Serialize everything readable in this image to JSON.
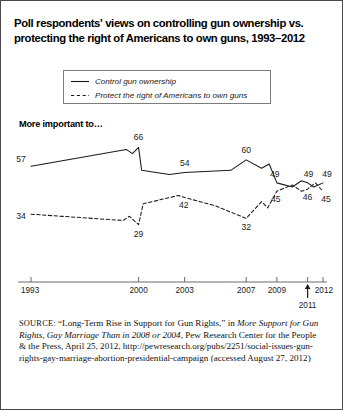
{
  "figure": {
    "title": "Poll respondents' views on controlling gun ownership vs.\nprotecting the right of Americans to own guns, 1993–2012",
    "axis_note": "More important to…"
  },
  "legend": {
    "items": [
      {
        "label": "Control gun ownership",
        "style": "solid",
        "icon": "solid-line-icon"
      },
      {
        "label": "Protect the right of Americans to own guns",
        "style": "dashed",
        "icon": "dashed-line-icon"
      }
    ]
  },
  "source": {
    "label": "SOURCE:",
    "text_1": " “Long-Term Rise in Support for Gun Rights,” in ",
    "italic_1": "More Support for Gun Rights, Gay Marriage Than in 2008 or 2004",
    "text_2": ", Pew Research Center for the People & the Press, April 25, 2012, http://pewresearch.org/pubs/2251/social-issues-gun-rights-gay-marriage-abortion-presidential-campaign (accessed August 27, 2012)"
  },
  "chart_data": {
    "type": "line",
    "title": "Poll respondents' views on controlling gun ownership vs. protecting the right of Americans to own guns, 1993–2012",
    "xlabel": "",
    "ylabel": "More important to…",
    "grid": false,
    "legend_position": "top-center",
    "xlim": [
      1993,
      2012
    ],
    "ylim": [
      25,
      70
    ],
    "xticks": [
      "1993",
      "2000",
      "2003",
      "2007",
      "2009",
      "2011",
      "2012"
    ],
    "annotations": [
      {
        "text": "2011",
        "type": "arrow-callout",
        "x": 2011
      }
    ],
    "series": [
      {
        "name": "Control gun ownership",
        "style": "solid",
        "color": "#1a1a1a",
        "points": [
          {
            "x": 1993.0,
            "y": 57,
            "label": "57"
          },
          {
            "x": 1999.2,
            "y": 65
          },
          {
            "x": 1999.6,
            "y": 63
          },
          {
            "x": 2000.0,
            "y": 66,
            "label": "66"
          },
          {
            "x": 2000.2,
            "y": 55
          },
          {
            "x": 2002.0,
            "y": 53
          },
          {
            "x": 2003.0,
            "y": 54,
            "label": "54"
          },
          {
            "x": 2006.0,
            "y": 55
          },
          {
            "x": 2007.0,
            "y": 60,
            "label": "60"
          },
          {
            "x": 2008.0,
            "y": 56
          },
          {
            "x": 2008.5,
            "y": 58
          },
          {
            "x": 2009.0,
            "y": 49,
            "label": "49"
          },
          {
            "x": 2010.0,
            "y": 47
          },
          {
            "x": 2010.6,
            "y": 50
          },
          {
            "x": 2011.0,
            "y": 49,
            "label": "49"
          },
          {
            "x": 2011.4,
            "y": 47
          },
          {
            "x": 2012.0,
            "y": 49,
            "label": "49"
          }
        ]
      },
      {
        "name": "Protect the right of Americans to own guns",
        "style": "dashed",
        "color": "#1a1a1a",
        "points": [
          {
            "x": 1993.0,
            "y": 34,
            "label": "34"
          },
          {
            "x": 1999.0,
            "y": 31
          },
          {
            "x": 1999.4,
            "y": 33
          },
          {
            "x": 2000.0,
            "y": 29,
            "label": "29"
          },
          {
            "x": 2000.3,
            "y": 39
          },
          {
            "x": 2002.6,
            "y": 43
          },
          {
            "x": 2003.0,
            "y": 42,
            "label": "42"
          },
          {
            "x": 2005.0,
            "y": 38
          },
          {
            "x": 2007.0,
            "y": 32,
            "label": "32"
          },
          {
            "x": 2008.0,
            "y": 40
          },
          {
            "x": 2008.4,
            "y": 37
          },
          {
            "x": 2009.0,
            "y": 45,
            "label": "45"
          },
          {
            "x": 2010.0,
            "y": 48
          },
          {
            "x": 2010.6,
            "y": 45
          },
          {
            "x": 2011.0,
            "y": 46,
            "label": "46"
          },
          {
            "x": 2011.5,
            "y": 49
          },
          {
            "x": 2012.0,
            "y": 45,
            "label": "45"
          }
        ]
      }
    ]
  }
}
